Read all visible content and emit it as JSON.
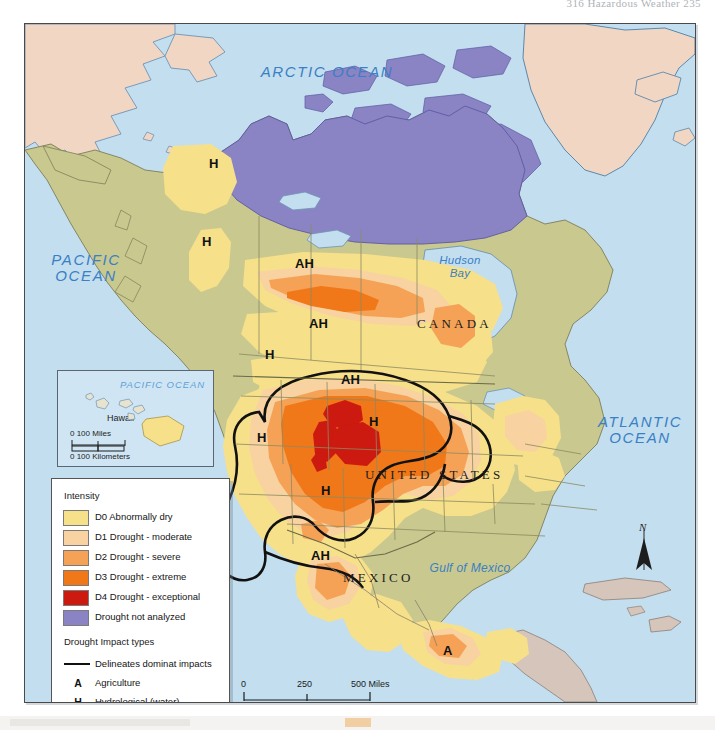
{
  "header": {
    "running_head": "316  Hazardous Weather  235"
  },
  "map": {
    "frame": {
      "border_color": "#4a4a4a",
      "ocean_color": "#c2deef"
    },
    "ocean_labels": [
      {
        "name": "arctic-ocean",
        "text": "ARCTIC OCEAN",
        "x": 248,
        "y": 48,
        "size": "lg"
      },
      {
        "name": "pacific-ocean",
        "text": "PACIFIC\nOCEAN",
        "x": 35,
        "y": 255,
        "size": "lg"
      },
      {
        "name": "atlantic-ocean",
        "text": "ATLANTIC\nOCEAN",
        "x": 598,
        "y": 416,
        "size": "lg"
      }
    ],
    "water_labels": [
      {
        "name": "hudson-bay",
        "text": "Hudson\nBay",
        "x": 437,
        "y": 258
      },
      {
        "name": "gulf-of-mexico",
        "text": "Gulf of Mexico",
        "x": 432,
        "y": 566
      }
    ],
    "country_labels": [
      {
        "name": "canada",
        "text": "CANADA",
        "x": 414,
        "y": 318
      },
      {
        "name": "united-states",
        "text": "UNITED STATES",
        "x": 366,
        "y": 470
      },
      {
        "name": "mexico",
        "text": "MEXICO",
        "x": 340,
        "y": 572
      }
    ],
    "impact_markers": [
      {
        "name": "impact-marker-yukon",
        "text": "H",
        "x": 210,
        "y": 160
      },
      {
        "name": "impact-marker-bc-coast",
        "text": "H",
        "x": 203,
        "y": 238
      },
      {
        "name": "impact-marker-nwt-south",
        "text": "AH",
        "x": 303,
        "y": 261
      },
      {
        "name": "impact-marker-prairies",
        "text": "AH",
        "x": 317,
        "y": 319
      },
      {
        "name": "impact-marker-pnw",
        "text": "H",
        "x": 266,
        "y": 351
      },
      {
        "name": "impact-marker-northplains",
        "text": "AH",
        "x": 347,
        "y": 376
      },
      {
        "name": "impact-marker-greatplains",
        "text": "H",
        "x": 370,
        "y": 418
      },
      {
        "name": "impact-marker-greatbasin",
        "text": "H",
        "x": 258,
        "y": 434
      },
      {
        "name": "impact-marker-southwest",
        "text": "H",
        "x": 322,
        "y": 487
      },
      {
        "name": "impact-marker-nwmexico",
        "text": "AH",
        "x": 317,
        "y": 552
      },
      {
        "name": "impact-marker-smexico",
        "text": "A",
        "x": 445,
        "y": 647
      }
    ],
    "north_arrow": {
      "label": "N"
    },
    "scale_bars": [
      {
        "name": "scale-miles",
        "ticks": [
          "0",
          "250",
          "500 Miles"
        ]
      },
      {
        "name": "scale-kilometers",
        "ticks": [
          "0",
          "250",
          "500 Kilometers"
        ]
      }
    ]
  },
  "hawaii_inset": {
    "ocean_label": "PACIFIC OCEAN",
    "place_label": "Hawaii",
    "scale_miles": "0     100 Miles",
    "scale_km": "0  100 Kilometers"
  },
  "legend": {
    "intensity_title": "Intensity",
    "intensity_items": [
      {
        "name": "legend-d0",
        "color": "#f7e08a",
        "label": "D0 Abnormally dry"
      },
      {
        "name": "legend-d1",
        "color": "#f8d2a0",
        "label": "D1 Drought - moderate"
      },
      {
        "name": "legend-d2",
        "color": "#f5a257",
        "label": "D2 Drought - severe"
      },
      {
        "name": "legend-d3",
        "color": "#f07818",
        "label": "D3 Drought - extreme"
      },
      {
        "name": "legend-d4",
        "color": "#cc1a10",
        "label": "D4 Drought - exceptional"
      },
      {
        "name": "legend-not-analyzed",
        "color": "#8a84c4",
        "label": "Drought not analyzed"
      }
    ],
    "impact_title": "Drought Impact types",
    "impact_items": [
      {
        "name": "legend-dominant-line",
        "key": "line",
        "label": "Delineates dominat impacts"
      },
      {
        "name": "legend-agriculture",
        "key": "A",
        "label": "Agriculture"
      },
      {
        "name": "legend-hydrological",
        "key": "H",
        "label": "Hydrological (water)"
      },
      {
        "name": "legend-both",
        "key": "AH",
        "label": "Both impacts"
      }
    ]
  }
}
